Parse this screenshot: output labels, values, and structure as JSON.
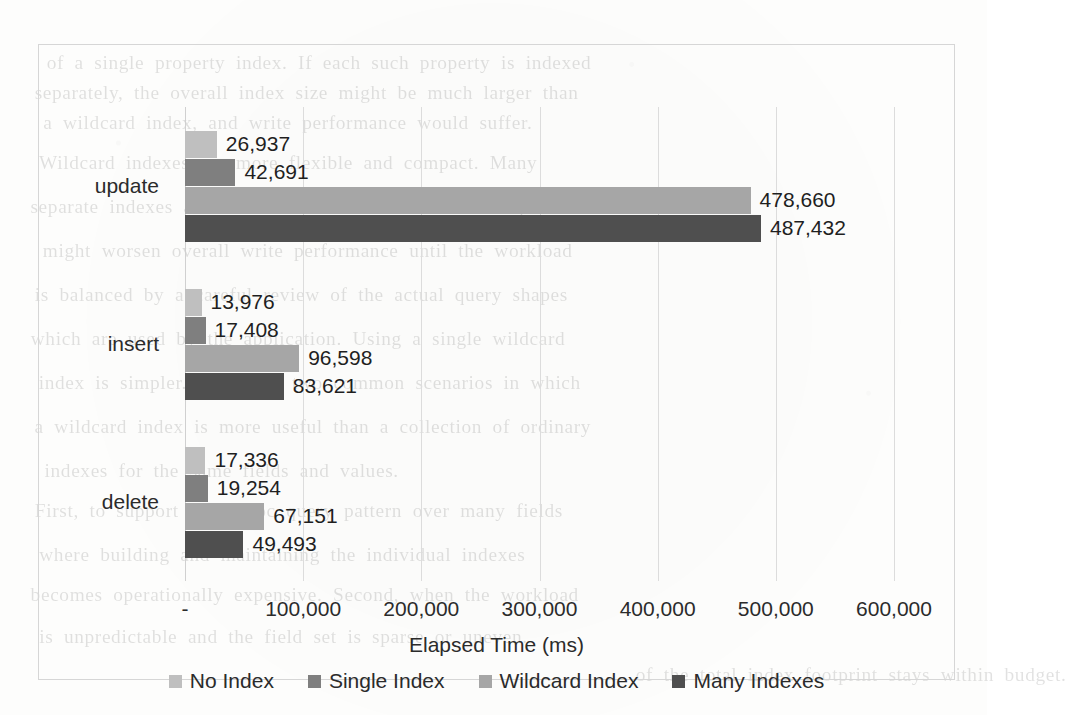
{
  "chart_data": {
    "type": "bar",
    "orientation": "horizontal",
    "title": "",
    "xlabel": "Elapsed Time (ms)",
    "ylabel": "",
    "xlim": [
      0,
      600000
    ],
    "grid": true,
    "legend_position": "bottom",
    "categories": [
      "update",
      "insert",
      "delete"
    ],
    "tick_labels": [
      "-",
      "100,000",
      "200,000",
      "300,000",
      "400,000",
      "500,000",
      "600,000"
    ],
    "tick_values": [
      0,
      100000,
      200000,
      300000,
      400000,
      500000,
      600000
    ],
    "series": [
      {
        "name": "No Index",
        "color": "#bfbfbf",
        "values": [
          26937,
          13976,
          17336
        ],
        "labels": [
          "26,937",
          "13,976",
          "17,336"
        ]
      },
      {
        "name": "Single Index",
        "color": "#7f7f7f",
        "values": [
          42691,
          17408,
          19254
        ],
        "labels": [
          "42,691",
          "17,408",
          "19,254"
        ]
      },
      {
        "name": "Wildcard Index",
        "color": "#a6a6a6",
        "values": [
          478660,
          96598,
          67151
        ],
        "labels": [
          "478,660",
          "96,598",
          "67,151"
        ]
      },
      {
        "name": "Many Indexes",
        "color": "#4f4f4f",
        "values": [
          487432,
          83621,
          49493
        ],
        "labels": [
          "487,432",
          "83,621",
          "49,493"
        ]
      }
    ]
  },
  "bleed_through_text": [
    {
      "text": "of a single property index. If each such property is indexed",
      "x": 52,
      "y": 52
    },
    {
      "text": "separately, the overall index size might be much larger than",
      "x": 40,
      "y": 82
    },
    {
      "text": "a wildcard index, and write performance would suffer.",
      "x": 48,
      "y": 112
    },
    {
      "text": "Wildcard indexes are more flexible and compact. Many",
      "x": 44,
      "y": 152
    },
    {
      "text": "separate indexes add overhead to index maintenance operations",
      "x": 36,
      "y": 196
    },
    {
      "text": "might worsen overall write performance until the workload",
      "x": 48,
      "y": 240
    },
    {
      "text": "is balanced by a careful review of the actual query shapes",
      "x": 40,
      "y": 284
    },
    {
      "text": "which are used by the application. Using a single wildcard",
      "x": 36,
      "y": 328
    },
    {
      "text": "index is simpler. There are two common scenarios in which",
      "x": 44,
      "y": 372
    },
    {
      "text": "a wildcard index is more useful than a collection of ordinary",
      "x": 40,
      "y": 416
    },
    {
      "text": "indexes for the same fields and values.",
      "x": 48,
      "y": 460
    },
    {
      "text": "First, to support an ad-hoc query pattern over many fields",
      "x": 40,
      "y": 500
    },
    {
      "text": "where building and maintaining the individual indexes",
      "x": 44,
      "y": 544
    },
    {
      "text": "becomes operationally expensive. Second, when the workload",
      "x": 36,
      "y": 584
    },
    {
      "text": "is unpredictable and the field set is sparse or uneven.",
      "x": 44,
      "y": 626
    },
    {
      "text": "of the total index footprint stays within budget.",
      "x": 640,
      "y": 664
    }
  ]
}
